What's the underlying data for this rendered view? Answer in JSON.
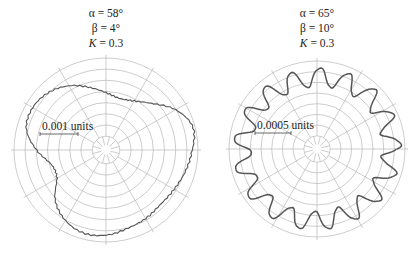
{
  "chart_data": [
    {
      "type": "polar",
      "title_lines": [
        "α = 58°",
        "β = 4°",
        "K = 0.3"
      ],
      "params": {
        "alpha": "58°",
        "beta": "4°",
        "K": "0.3"
      },
      "scale_label": "0.001 units",
      "grid": {
        "rings": 7,
        "spoke_step_deg": 30,
        "inner_ticks": 12
      },
      "center": [
        106,
        150
      ],
      "outer_radius": 92,
      "curve": {
        "description": "Heart/kidney-shaped radial error profile; lobes toward upper-left and right, cusp toward left, narrow toward bottom",
        "angles_deg": [
          0,
          15,
          30,
          45,
          60,
          75,
          90,
          105,
          120,
          135,
          150,
          165,
          180,
          195,
          210,
          225,
          240,
          255,
          270,
          285,
          300,
          315,
          330,
          345
        ],
        "radii_frac": [
          0.94,
          0.98,
          0.88,
          0.72,
          0.62,
          0.58,
          0.62,
          0.7,
          0.8,
          0.88,
          0.92,
          0.9,
          0.76,
          0.62,
          0.62,
          0.78,
          0.88,
          0.93,
          0.92,
          0.88,
          0.86,
          0.84,
          0.86,
          0.9
        ]
      }
    },
    {
      "type": "polar",
      "title_lines": [
        "α = 65°",
        "β = 10°",
        "K = 0.3"
      ],
      "params": {
        "alpha": "65°",
        "beta": "10°",
        "K": "0.3"
      },
      "scale_label": "0.0005 units",
      "grid": {
        "rings": 7,
        "spoke_step_deg": 30,
        "inner_ticks": 12
      },
      "center": [
        317,
        149
      ],
      "outer_radius": 88,
      "curve": {
        "description": "Near-circular profile with ~17 sinusoidal lobes",
        "lobes": 17,
        "mean_radius_frac": 0.83,
        "amplitude_frac": 0.11
      }
    }
  ],
  "panels": [
    {
      "alpha": "α = 58°",
      "beta": "β = 4°",
      "k_sym": "K",
      "k_val": " = 0.3",
      "scale": "0.001 units"
    },
    {
      "alpha": "α = 65°",
      "beta": "β = 10°",
      "k_sym": "K",
      "k_val": " = 0.3",
      "scale": "0.0005 units"
    }
  ],
  "colors": {
    "grid": "#b8b8b8",
    "curve": "#555555",
    "text": "#222222"
  }
}
